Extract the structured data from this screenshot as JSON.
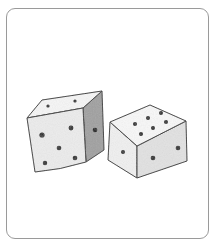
{
  "illustration": {
    "subject": "two-dice",
    "style": "pencil-sketch",
    "colors": {
      "card_border": "#9a9a9a",
      "outline": "#3a3a3a",
      "pip": "#2a2a2a",
      "face_light": "#f3f3f3",
      "face_mid": "#e4e4e4",
      "face_dark": "#9c9c9c"
    },
    "dice": [
      {
        "name": "left-die",
        "faces": {
          "top": {
            "pips": 2
          },
          "front": {
            "pips": 5
          },
          "side": {
            "pips": 1
          }
        }
      },
      {
        "name": "right-die",
        "faces": {
          "top": {
            "pips": 6
          },
          "left": {
            "pips": 1
          },
          "right": {
            "pips": 2
          }
        }
      }
    ]
  }
}
